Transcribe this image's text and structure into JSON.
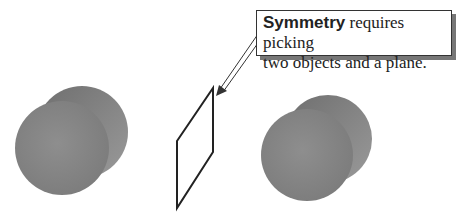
{
  "callout": {
    "keyword": "Symmetry",
    "text_line1": " requires picking",
    "text_line2": "two objects and a plane."
  },
  "objects": [
    {
      "name": "left-cylinder",
      "color": "#8a8a8a"
    },
    {
      "name": "mirror-plane",
      "color": "#222222"
    },
    {
      "name": "right-cylinder",
      "color": "#8a8a8a"
    }
  ]
}
